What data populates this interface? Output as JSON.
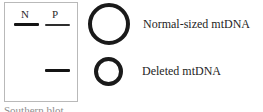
{
  "figure": {
    "width": 263,
    "height": 112,
    "background_color": "#ffffff"
  },
  "gel": {
    "caption": "Southern blot",
    "border_color": "#b9b9b9",
    "lanes": [
      {
        "id": "n",
        "label": "N"
      },
      {
        "id": "p",
        "label": "P"
      }
    ],
    "bands": [
      {
        "id": "n-normal",
        "lane": "N",
        "species": "normal-sized mtDNA",
        "intensity": "strong",
        "color": "#141414"
      },
      {
        "id": "p-normal",
        "lane": "P",
        "species": "normal-sized mtDNA",
        "intensity": "faint",
        "color": "#2e2e2e"
      },
      {
        "id": "p-deleted",
        "lane": "P",
        "species": "deleted mtDNA",
        "intensity": "strong",
        "color": "#141414"
      }
    ]
  },
  "legend": {
    "items": [
      {
        "icon": "large-circle-icon",
        "label": "Normal-sized mtDNA",
        "stroke_color": "#1a1a1a"
      },
      {
        "icon": "small-circle-icon",
        "label": "Deleted mtDNA",
        "stroke_color": "#1a1a1a"
      }
    ]
  }
}
